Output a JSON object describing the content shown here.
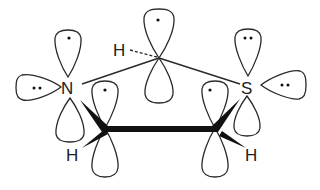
{
  "diagram": {
    "type": "orbital-diagram",
    "atoms": {
      "nitrogen": "N",
      "sulfur": "S",
      "h_top": "H",
      "h_left": "H",
      "h_right": "H"
    },
    "electron_marks": {
      "single": "•",
      "pair": "••"
    },
    "colors": {
      "stroke": "#2a2a2a",
      "bond": "#111111",
      "background": "#ffffff"
    }
  }
}
